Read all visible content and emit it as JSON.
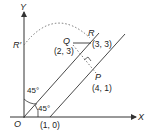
{
  "axes": {
    "x_label": "X",
    "y_label": "Y",
    "origin_label": "O"
  },
  "points": {
    "R_prime": {
      "label": "R′"
    },
    "Q": {
      "label": "Q",
      "coords": "(2, 3)"
    },
    "R": {
      "label": "R",
      "coords": "(3, 3)"
    },
    "P": {
      "label": "P",
      "coords": "(4, 1)"
    },
    "A": {
      "coords": "(1, 0)"
    }
  },
  "angles": {
    "upper": "45°",
    "lower": "45°"
  },
  "colors": {
    "line": "#444444",
    "dotted": "#666666"
  }
}
